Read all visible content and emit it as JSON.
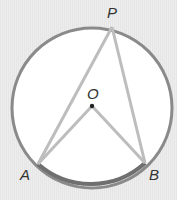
{
  "diagram": {
    "type": "circle-inscribed-angle",
    "points": {
      "P": {
        "label": "P",
        "x": 112,
        "y": 27
      },
      "O": {
        "label": "O",
        "x": 92,
        "y": 106
      },
      "A": {
        "label": "A",
        "x": 38,
        "y": 164
      },
      "B": {
        "label": "B",
        "x": 145,
        "y": 163
      }
    },
    "circle": {
      "cx": 92,
      "cy": 108,
      "r": 80
    },
    "segments": [
      "PA",
      "PB",
      "OA",
      "OB"
    ],
    "highlighted_arc": "AB",
    "colors": {
      "circle": "#8a8a8a",
      "arc": "#7a7a7a",
      "segments": "#b8b8b8",
      "fill": "#ffffff",
      "background": "#e9e9e9"
    }
  }
}
